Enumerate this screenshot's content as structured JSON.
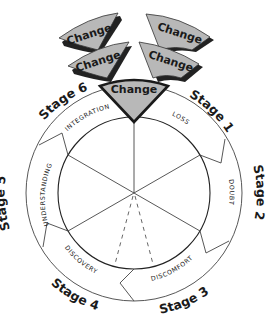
{
  "diagram": {
    "type": "change-cycle",
    "center_label": "",
    "change_tabs": [
      {
        "id": "tab-top-left",
        "label": "Change"
      },
      {
        "id": "tab-top-right",
        "label": "Change"
      },
      {
        "id": "tab-mid-left",
        "label": "Change"
      },
      {
        "id": "tab-mid-right",
        "label": "Change"
      },
      {
        "id": "tab-center",
        "label": "Change"
      }
    ],
    "stages": [
      {
        "label": "Stage 1",
        "phase": "LOSS"
      },
      {
        "label": "Stage 2",
        "phase": "DOUBT"
      },
      {
        "label": "Stage 3",
        "phase": "DISCOMFORT"
      },
      {
        "label": "Stage 4",
        "phase": "DISCOVERY"
      },
      {
        "label": "Stage 5",
        "phase": "UNDERSTANDING"
      },
      {
        "label": "Stage 6",
        "phase": "INTEGRATION"
      }
    ],
    "colors": {
      "tab_fill": "#b8b8b8",
      "tab_shadow": "#222222",
      "line": "#333333",
      "background": "#ffffff"
    }
  }
}
